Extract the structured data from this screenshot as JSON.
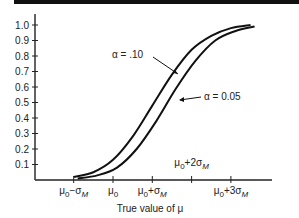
{
  "chart_data": {
    "type": "line",
    "title": "",
    "xlabel": "True value of μ",
    "ylabel": "",
    "ylim": [
      0,
      1.0
    ],
    "y_ticks": [
      "0.1",
      "0.2",
      "0.3",
      "0.4",
      "0.5",
      "0.6",
      "0.7",
      "0.8",
      "0.9",
      "1.0"
    ],
    "x_ticks": [
      "μ0−σM",
      "μ0",
      "μ0+σM",
      "μ0+2σM",
      "μ0+3σM"
    ],
    "x": [
      -1,
      -0.5,
      0,
      0.5,
      1,
      1.5,
      2,
      2.5,
      3,
      3.5
    ],
    "series": [
      {
        "name": "α = .10",
        "values": [
          0.02,
          0.05,
          0.13,
          0.28,
          0.48,
          0.68,
          0.84,
          0.93,
          0.98,
          1.0
        ]
      },
      {
        "name": "α = 0.05",
        "values": [
          0.01,
          0.03,
          0.08,
          0.2,
          0.38,
          0.59,
          0.77,
          0.9,
          0.96,
          0.99
        ]
      }
    ],
    "annotations": [
      "α = .10",
      "α = 0.05"
    ],
    "grid": false,
    "legend": "inline annotations with arrows"
  },
  "labels": {
    "xlabel": "True value of μ",
    "alpha10": "α = .10",
    "alpha05": "α = 0.05",
    "x_tick_2sigma": "μ0+2σM"
  }
}
